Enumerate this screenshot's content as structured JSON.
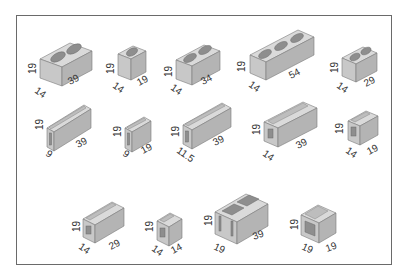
{
  "diagram": {
    "title": "",
    "units": "cm",
    "colors": {
      "frame": "#6a6a6a",
      "top": "#d9d9d9",
      "front": "#c6c6c6",
      "side": "#b3b3b3",
      "cavity": "#8c8c8c",
      "edge": "#7a7a7a",
      "text": "#333333"
    },
    "rows": [
      {
        "row": 1,
        "blocks": [
          {
            "id": "b1",
            "type": "hollow-2-cell",
            "height": "19",
            "depth": "14",
            "length": "39"
          },
          {
            "id": "b2",
            "type": "hollow-1-cell",
            "height": "19",
            "depth": "14",
            "length": "19"
          },
          {
            "id": "b3",
            "type": "hollow-2-cell",
            "height": "19",
            "depth": "14",
            "length": "34"
          },
          {
            "id": "b4",
            "type": "hollow-3-cell",
            "height": "19",
            "depth": "14",
            "length": "54"
          },
          {
            "id": "b5",
            "type": "hollow-2-cell",
            "height": "19",
            "depth": "14",
            "length": "29"
          }
        ]
      },
      {
        "row": 2,
        "blocks": [
          {
            "id": "b6",
            "type": "u-channel-long",
            "height": "19",
            "depth": "9",
            "length": "39"
          },
          {
            "id": "b7",
            "type": "u-channel-short",
            "height": "19",
            "depth": "9",
            "length": "19"
          },
          {
            "id": "b8",
            "type": "u-channel-long",
            "height": "19",
            "depth": "11.5",
            "length": "39"
          },
          {
            "id": "b9",
            "type": "u-channel-long",
            "height": "19",
            "depth": "14",
            "length": "39"
          },
          {
            "id": "b10",
            "type": "u-channel-short",
            "height": "19",
            "depth": "14",
            "length": "19"
          }
        ]
      },
      {
        "row": 3,
        "blocks": [
          {
            "id": "b11",
            "type": "u-channel-long",
            "height": "19",
            "depth": "14",
            "length": "29"
          },
          {
            "id": "b12",
            "type": "u-channel-short",
            "height": "19",
            "depth": "14",
            "length": "14"
          },
          {
            "id": "b13",
            "type": "hollow-2-cell-open-end",
            "height": "19",
            "depth": "19",
            "length": "39"
          },
          {
            "id": "b14",
            "type": "u-channel-short",
            "height": "19",
            "depth": "19",
            "length": "19"
          }
        ]
      }
    ]
  }
}
